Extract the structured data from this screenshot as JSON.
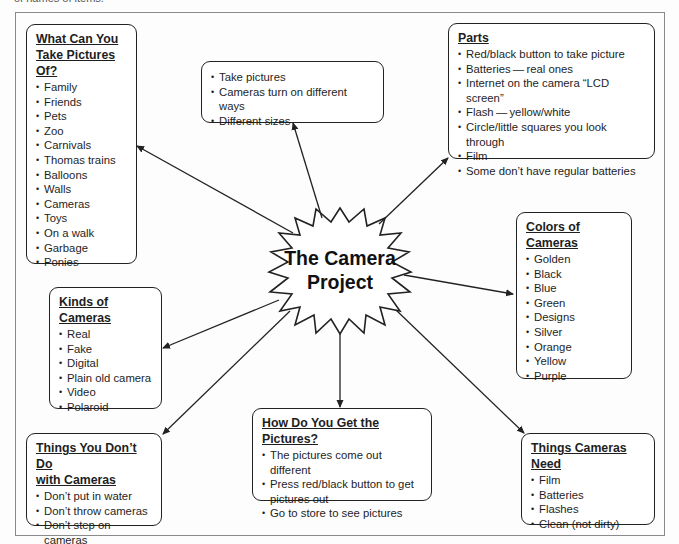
{
  "caption": "of names of items.",
  "center": {
    "title_line1": "The Camera",
    "title_line2": "Project"
  },
  "boxes": {
    "take_pictures_of": {
      "title_line1": "What Can You",
      "title_line2": "Take Pictures Of?",
      "items": [
        "Family",
        "Friends",
        "Pets",
        "Zoo",
        "Carnivals",
        "Thomas trains",
        "Balloons",
        "Walls",
        "Cameras",
        "Toys",
        "On a walk",
        "Garbage",
        "Ponies"
      ]
    },
    "general": {
      "items": [
        "Take pictures",
        "Cameras turn on different ways",
        "Different sizes"
      ]
    },
    "parts": {
      "title": "Parts",
      "items": [
        "Red/black button to take picture",
        "Batteries — real ones",
        "Internet on the camera “LCD screen”",
        "Flash — yellow/white",
        "Circle/little squares you look through",
        "Film",
        "Some don’t have regular batteries"
      ]
    },
    "colors": {
      "title": "Colors of Cameras",
      "items": [
        "Golden",
        "Black",
        "Blue",
        "Green",
        "Designs",
        "Silver",
        "Orange",
        "Yellow",
        "Purple"
      ]
    },
    "kinds": {
      "title": "Kinds of Cameras",
      "items": [
        "Real",
        "Fake",
        "Digital",
        "Plain old camera",
        "Video",
        "Polaroid"
      ]
    },
    "dont_do": {
      "title_line1": "Things You Don’t Do",
      "title_line2": "with Cameras",
      "items": [
        "Don’t put in water",
        "Don’t throw cameras",
        "Don’t step on cameras"
      ]
    },
    "get_pictures": {
      "title": "How Do You Get the Pictures?",
      "items": [
        "The pictures come out different",
        "Press red/black button to get pictures out",
        "Go to store to see pictures"
      ]
    },
    "needs": {
      "title": "Things Cameras Need",
      "items": [
        "Film",
        "Batteries",
        "Flashes",
        "Clean (not dirty)"
      ]
    }
  },
  "colors": {
    "line": "#222222",
    "background": "#fdfdfd",
    "frame": "#8a8a8a"
  }
}
